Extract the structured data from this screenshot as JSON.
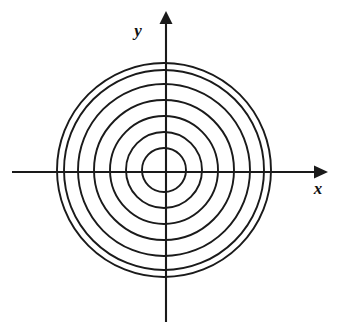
{
  "figure": {
    "background_color": "#ffffff",
    "ink_color": "#1a1a1a",
    "width": 338,
    "height": 334
  },
  "axes": {
    "x_label": "x",
    "y_label": "y",
    "x_label_position": {
      "x": 317,
      "y": 190
    },
    "y_label_position": {
      "x": 138,
      "y": 35
    },
    "origin": {
      "x": 166,
      "y": 172
    },
    "x_axis": {
      "x_start": 12,
      "x_end": 322,
      "y": 172,
      "arrow": "right"
    },
    "y_axis": {
      "y_start": 14,
      "y_end": 322,
      "x": 166,
      "arrow": "up"
    }
  },
  "chart_data": {
    "type": "scatter",
    "xlabel": "x",
    "ylabel": "y",
    "grid": false,
    "legend": "none",
    "axis_arrows": [
      "x-positive",
      "y-positive"
    ],
    "center": {
      "x": 164,
      "y": 170
    },
    "circle_count": 7,
    "radii_px": [
      22,
      38,
      54,
      70,
      86,
      100,
      107
    ],
    "x_axis_crossings_px": [
      57,
      64,
      78,
      94,
      110,
      126,
      142,
      186,
      202,
      218,
      234,
      250,
      264,
      271
    ],
    "y_axis_crossings_px": [
      63,
      70,
      84,
      100,
      116,
      132,
      148,
      192,
      208,
      224,
      240,
      256,
      270,
      277
    ]
  }
}
